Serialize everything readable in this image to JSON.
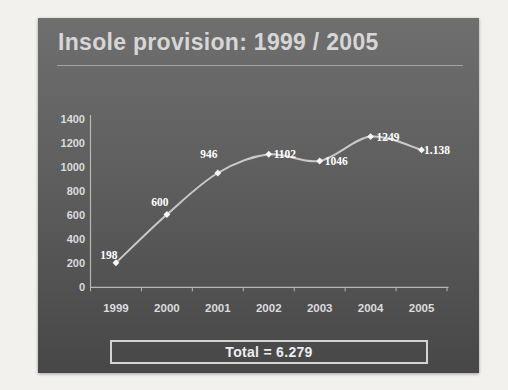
{
  "slide": {
    "title": "Insole provision: 1999 / 2005",
    "total": "Total = 6.279"
  },
  "chart_data": {
    "type": "line",
    "title": "",
    "xlabel": "",
    "ylabel": "",
    "categories": [
      "1999",
      "2000",
      "2001",
      "2002",
      "2003",
      "2004",
      "2005"
    ],
    "series": [
      {
        "name": "Insole provision",
        "values": [
          198,
          600,
          946,
          1102,
          1046,
          1249,
          1138
        ]
      }
    ],
    "data_labels": [
      "198",
      "600",
      "946",
      "1102",
      "1046",
      "1249",
      "1.138"
    ],
    "ylim": [
      0,
      1400
    ],
    "yticks": [
      0,
      200,
      400,
      600,
      800,
      1000,
      1200,
      1400
    ],
    "grid": false,
    "legend": "none",
    "marker": "diamond",
    "line_smooth": true,
    "colors": {
      "line": "#c9c9c9",
      "marker": "#f5f5f5",
      "axis": "#b7b7b7",
      "axis_text": "#dcdcdc",
      "data_label": "#ffffff",
      "slide_top": "#6f6f6f",
      "slide_bottom": "#474747",
      "title_text": "#d6d6d6",
      "total_border": "#d3d3d3",
      "total_text": "#ededed",
      "page_bg": "#f3f1ed"
    }
  }
}
